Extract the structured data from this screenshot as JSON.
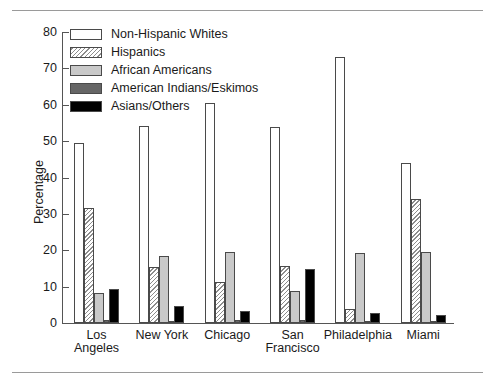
{
  "chart_data": {
    "type": "bar",
    "title": "",
    "xlabel": "",
    "ylabel": "Percentage",
    "ylim": [
      0,
      80
    ],
    "ytick_step": 10,
    "yticks": [
      0,
      10,
      20,
      30,
      40,
      50,
      60,
      70,
      80
    ],
    "grid": false,
    "legend_position": "top-left inside plot",
    "categories": [
      "Los Angeles",
      "New York",
      "Chicago",
      "San Francisco",
      "Philadelphia",
      "Miami"
    ],
    "category_lines": [
      [
        "Los",
        "Angeles"
      ],
      [
        "New York"
      ],
      [
        "Chicago"
      ],
      [
        "San",
        "Francisco"
      ],
      [
        "Philadelphia"
      ],
      [
        "Miami"
      ]
    ],
    "series": [
      {
        "name": "Non-Hispanic Whites",
        "fill": "#ffffff",
        "pattern": "solid",
        "values": [
          49.5,
          54.2,
          60.5,
          54.0,
          73.2,
          44.0
        ]
      },
      {
        "name": "Hispanics",
        "fill": "#ffffff",
        "pattern": "diagonal-hatch",
        "values": [
          31.6,
          15.4,
          11.2,
          15.8,
          3.9,
          34.0
        ]
      },
      {
        "name": "African Americans",
        "fill": "#c9c9c9",
        "pattern": "solid",
        "values": [
          8.3,
          18.3,
          19.4,
          8.8,
          19.2,
          19.4
        ]
      },
      {
        "name": "American Indians/Eskimos",
        "fill": "#666666",
        "pattern": "solid",
        "values": [
          0.7,
          0.6,
          0.8,
          0.8,
          0.6,
          0.6
        ]
      },
      {
        "name": "Asians/Others",
        "fill": "#000000",
        "pattern": "solid",
        "values": [
          9.3,
          4.8,
          3.3,
          14.9,
          2.7,
          2.2
        ]
      }
    ]
  },
  "legend": {
    "items": [
      {
        "label": "Non-Hispanic Whites",
        "swatch": "white-swatch"
      },
      {
        "label": "Hispanics",
        "swatch": "hatched-swatch"
      },
      {
        "label": "African Americans",
        "swatch": "light-gray-swatch"
      },
      {
        "label": "American Indians/Eskimos",
        "swatch": "dark-gray-swatch"
      },
      {
        "label": "Asians/Others",
        "swatch": "black-swatch"
      }
    ]
  }
}
